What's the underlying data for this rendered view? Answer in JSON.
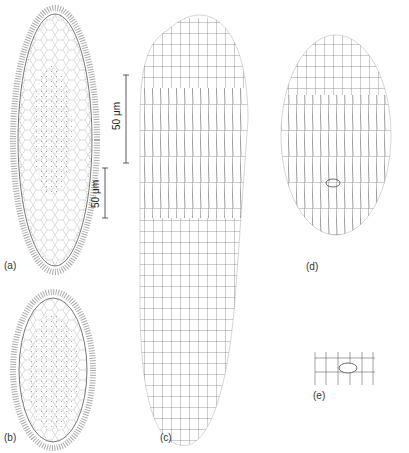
{
  "figure": {
    "panels": [
      {
        "id": "a",
        "label": "(a)",
        "description": "Ciliated elongate cell, live view with cilia fringe and dotted cytoplasm"
      },
      {
        "id": "b",
        "label": "(b)",
        "description": "Shorter ciliated cell with dotted cytoplasm"
      },
      {
        "id": "c",
        "label": "(c)",
        "description": "Elongate cell showing polygonal silverline pattern with transverse rows"
      },
      {
        "id": "d",
        "label": "(d)",
        "description": "Oval cell showing silverline pattern with transverse bands and cytostome"
      },
      {
        "id": "e",
        "label": "(e)",
        "description": "Detail of cytostome region"
      }
    ],
    "scale_bars": [
      {
        "id": "scale-bar-1",
        "text": "50 μm"
      },
      {
        "id": "scale-bar-2",
        "text": "50 μm"
      }
    ],
    "colors": {
      "line": "#555555",
      "cilia": "#666666",
      "background": "#ffffff"
    }
  }
}
